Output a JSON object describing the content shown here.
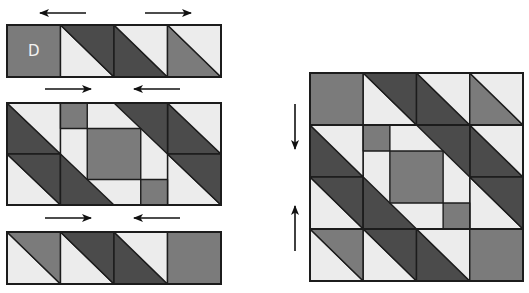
{
  "diagram": {
    "title": "",
    "type": "quilt block assembly diagram",
    "colors": {
      "dark": "#4b4b4b",
      "medium": "#7b7b7b",
      "light": "#ececec",
      "stroke": "#1c1c1c",
      "label": "#f2f2f2"
    },
    "left_rows": [
      {
        "name": "row-1",
        "x": 7,
        "y": 25,
        "w": 214,
        "h": 52,
        "pressing_arrows": [
          "left",
          "right"
        ]
      },
      {
        "name": "row-2",
        "x": 7,
        "y": 103,
        "w": 214,
        "h": 102,
        "pressing_arrows": [
          "right",
          "left"
        ]
      },
      {
        "name": "row-3",
        "x": 7,
        "y": 232,
        "w": 214,
        "h": 52,
        "pressing_arrows": [
          "right",
          "left"
        ]
      }
    ],
    "unit_label": "D",
    "assembled_block": {
      "x": 310,
      "y": 73,
      "w": 213,
      "h": 208,
      "pressing_arrows": [
        "down",
        "up"
      ]
    }
  }
}
